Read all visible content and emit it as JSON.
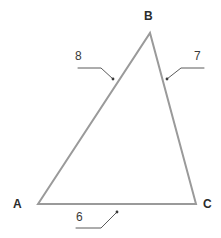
{
  "figure": {
    "type": "geometry-diagram",
    "shape": "triangle",
    "background_color": "#ffffff",
    "stroke_color": "#9a9a9a",
    "leader_color": "#5a5a5a",
    "label_color": "#2b2b2b",
    "number_color": "#3a3a3a",
    "stroke_width": 2,
    "vertices": [
      {
        "name": "A",
        "label": "A",
        "x": 38,
        "y": 204,
        "label_x": 13,
        "label_y": 198
      },
      {
        "name": "B",
        "label": "B",
        "x": 150,
        "y": 33,
        "label_x": 144,
        "label_y": 10
      },
      {
        "name": "C",
        "label": "C",
        "x": 196,
        "y": 204,
        "label_x": 203,
        "label_y": 198
      }
    ],
    "sides": [
      {
        "name": "side-ab",
        "label": "8",
        "from": "A",
        "to": "B",
        "label_x": 75,
        "label_y": 50,
        "leader": {
          "x1": 78,
          "y1": 68,
          "x2": 101,
          "y2": 68,
          "x3": 113,
          "y3": 79
        }
      },
      {
        "name": "side-bc",
        "label": "7",
        "from": "B",
        "to": "C",
        "label_x": 194,
        "label_y": 50,
        "leader": {
          "x1": 204,
          "y1": 68,
          "x2": 181,
          "y2": 68,
          "x3": 167,
          "y3": 79
        }
      },
      {
        "name": "side-ac",
        "label": "6",
        "from": "A",
        "to": "C",
        "label_x": 76,
        "label_y": 211,
        "leader": {
          "x1": 76,
          "y1": 228,
          "x2": 101,
          "y2": 228,
          "x3": 117,
          "y3": 212
        }
      }
    ]
  }
}
